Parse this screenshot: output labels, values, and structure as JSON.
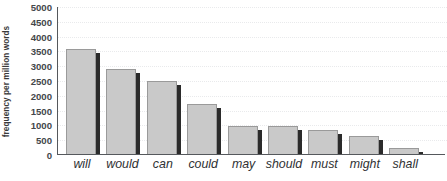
{
  "chart_data": {
    "type": "bar",
    "title": "",
    "subtitle": "",
    "xlabel": "",
    "ylabel": "frequency per million words",
    "categories": [
      "will",
      "would",
      "can",
      "could",
      "may",
      "should",
      "must",
      "might",
      "shall"
    ],
    "values": [
      3550,
      2880,
      2480,
      1700,
      950,
      950,
      820,
      620,
      200
    ],
    "series": [
      {
        "name": "frequency per million words",
        "values": [
          3550,
          2880,
          2480,
          1700,
          950,
          950,
          820,
          620,
          200
        ]
      }
    ],
    "ylim": [
      0,
      5000
    ],
    "ytick_step": 500,
    "ytick_labels": [
      "5000",
      "4500",
      "4000",
      "3500",
      "3000",
      "2500",
      "2000",
      "1500",
      "1000",
      "500",
      "0"
    ],
    "ytick_values": [
      5000,
      4500,
      4000,
      3500,
      3000,
      2500,
      2000,
      1500,
      1000,
      500,
      0
    ],
    "grid": true,
    "grid_axis": "y",
    "legend": false,
    "legend_position": "none",
    "bar_color": "#c9c9c9",
    "bar_edge_color": "#9a9a9a",
    "bar_shadow_color": "#2b2b2b",
    "gridline_color": "#e9eaec",
    "axis_color": "#55585c",
    "background_color": "#ffffff",
    "annotations": []
  }
}
